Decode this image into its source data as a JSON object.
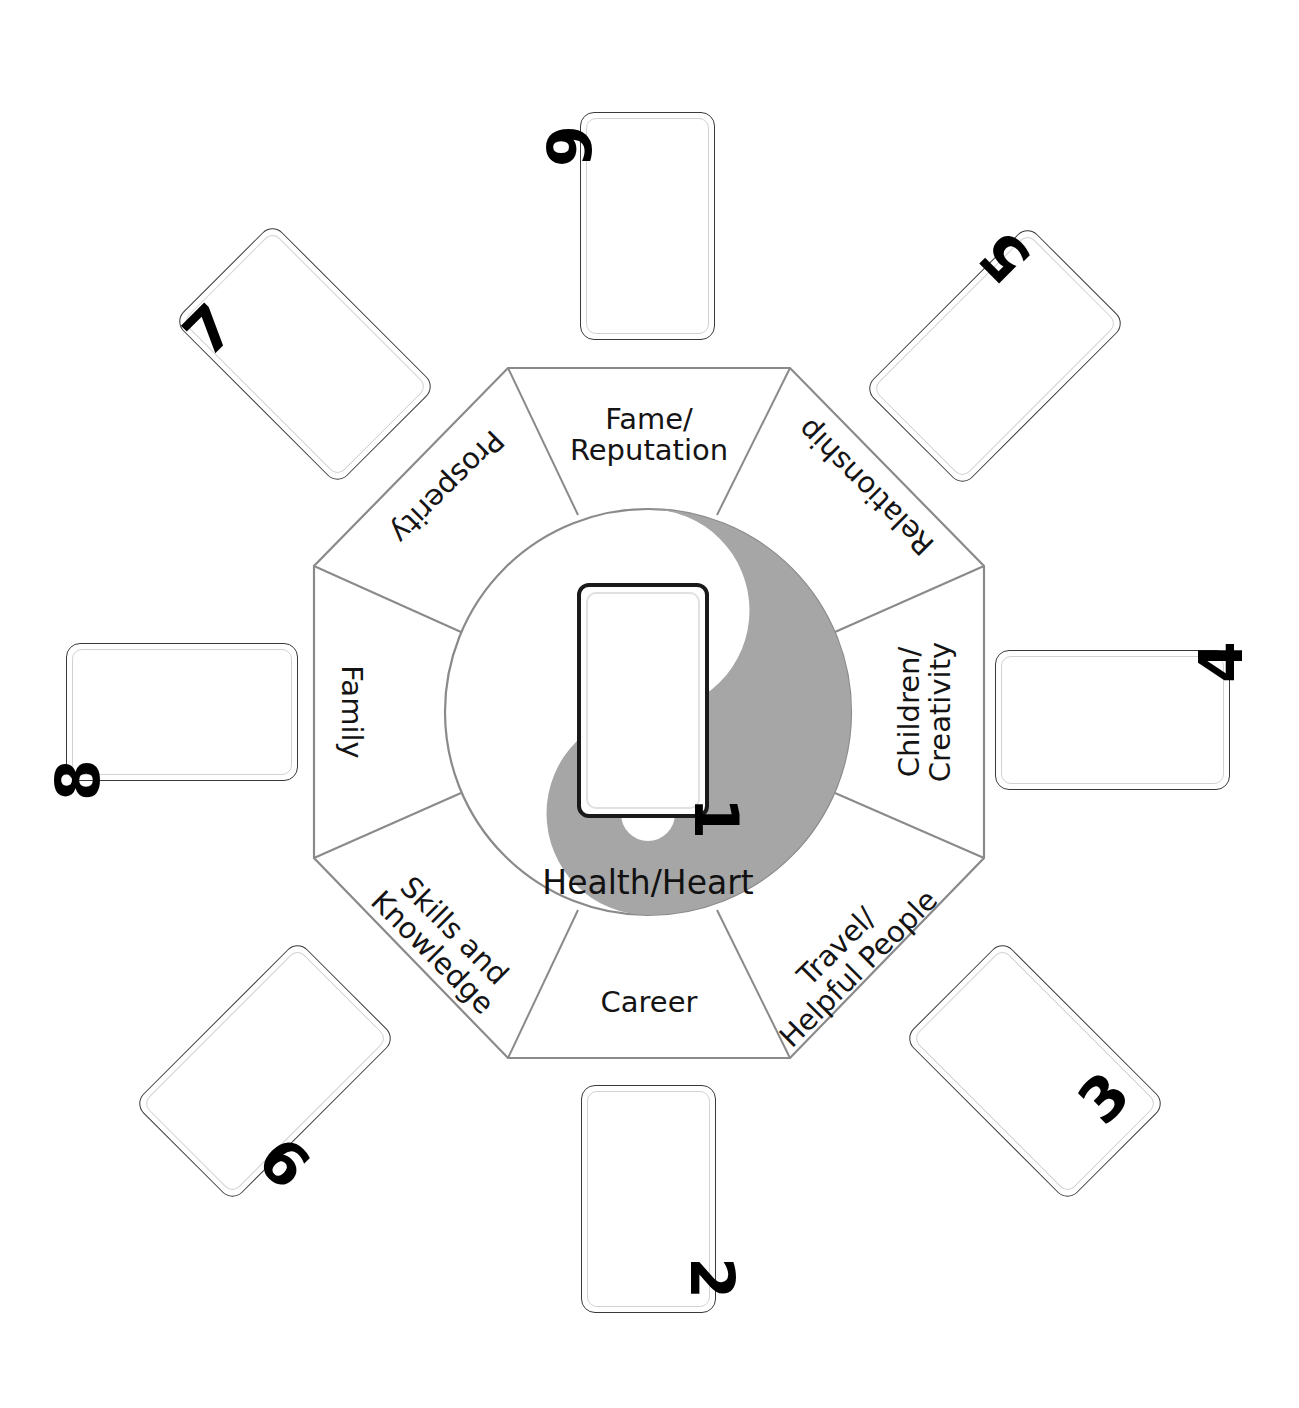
{
  "diagram": {
    "type": "bagua-octagon",
    "colors": {
      "yin_gray": "#a6a6a6",
      "outline": "#8c8c8c",
      "card_border": "#3a3a3a",
      "card_inner_border": "#d2d2d2",
      "text": "#141414",
      "background": "#ffffff"
    },
    "center_label": "Health/Heart",
    "sectors": [
      {
        "id": "fame",
        "label": "Fame/\nReputation",
        "line1": "Fame/",
        "line2": "Reputation",
        "position": "top",
        "rotation_deg": 0
      },
      {
        "id": "relationship",
        "label": "Relationship",
        "line1": "Relationship",
        "line2": "",
        "position": "top-right",
        "rotation_deg": 225
      },
      {
        "id": "children",
        "label": "Children/\nCreativity",
        "line1": "Children/",
        "line2": "Creativity",
        "position": "right",
        "rotation_deg": 270
      },
      {
        "id": "travel",
        "label": "Travel/\nHelpful People",
        "line1": "Travel/",
        "line2": "Helpful People",
        "position": "bottom-right",
        "rotation_deg": 315
      },
      {
        "id": "career",
        "label": "Career",
        "line1": "Career",
        "line2": "",
        "position": "bottom",
        "rotation_deg": 0
      },
      {
        "id": "skills",
        "label": "Skills and\nKnowledge",
        "line1": "Skills and",
        "line2": "Knowledge",
        "position": "bottom-left",
        "rotation_deg": 45
      },
      {
        "id": "family",
        "label": "Family",
        "line1": "Family",
        "line2": "",
        "position": "left",
        "rotation_deg": 90
      },
      {
        "id": "prosperity",
        "label": "Prosperity",
        "line1": "Prosperity",
        "line2": "",
        "position": "top-left",
        "rotation_deg": 135
      }
    ],
    "cards": [
      {
        "id": "card-1",
        "number": "1",
        "placement": "center",
        "orientation": "portrait",
        "rotation_deg": 0,
        "number_rotation_deg": 90
      },
      {
        "id": "card-2",
        "number": "2",
        "placement": "bottom",
        "orientation": "portrait",
        "rotation_deg": 0,
        "number_rotation_deg": 90
      },
      {
        "id": "card-3",
        "number": "3",
        "placement": "bottom-right",
        "orientation": "portrait",
        "rotation_deg": -45,
        "number_rotation_deg": 90
      },
      {
        "id": "card-4",
        "number": "4",
        "placement": "right",
        "orientation": "landscape",
        "rotation_deg": 0,
        "number_rotation_deg": -90
      },
      {
        "id": "card-5",
        "number": "5",
        "placement": "top-right",
        "orientation": "portrait",
        "rotation_deg": 45,
        "number_rotation_deg": -90
      },
      {
        "id": "card-6",
        "number": "6",
        "placement": "bottom-left",
        "orientation": "portrait",
        "rotation_deg": 45,
        "number_rotation_deg": 90
      },
      {
        "id": "card-7",
        "number": "7",
        "placement": "top-left",
        "orientation": "portrait",
        "rotation_deg": -45,
        "number_rotation_deg": -90
      },
      {
        "id": "card-8",
        "number": "8",
        "placement": "left",
        "orientation": "landscape",
        "rotation_deg": 0,
        "number_rotation_deg": 90
      },
      {
        "id": "card-9",
        "number": "9",
        "placement": "top",
        "orientation": "portrait",
        "rotation_deg": 0,
        "number_rotation_deg": -90
      }
    ],
    "taiji": {
      "description": "yin-yang circle inside octagon",
      "yin_side": "right",
      "yang_side": "left",
      "small_dot_top_color": "#a6a6a6",
      "small_dot_bottom_color": "#ffffff"
    }
  }
}
